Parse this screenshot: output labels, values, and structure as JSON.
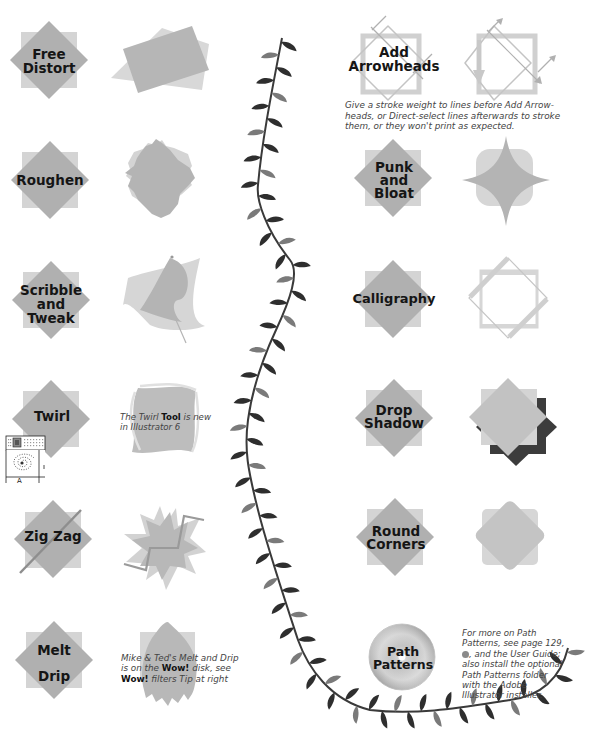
{
  "page": {
    "top_cutoff_text": "...",
    "colors": {
      "square_light": "#d4d4d4",
      "diamond_mid": "#b0b0b0",
      "result_fill": "#b6b6b6",
      "shadow_dark": "#3c3c3c",
      "vine_dark": "#2e2e2e",
      "vine_light": "#7a7a7a",
      "label_text": "#151515",
      "note_text": "#444444"
    }
  },
  "filters": {
    "left": [
      {
        "id": "free-distort",
        "label_lines": [
          "Free",
          "Distort"
        ]
      },
      {
        "id": "roughen",
        "label_lines": [
          "Roughen"
        ]
      },
      {
        "id": "scribble-tweak",
        "label_lines": [
          "Scribble",
          "and",
          "Tweak"
        ]
      },
      {
        "id": "twirl",
        "label_lines": [
          "Twirl"
        ]
      },
      {
        "id": "zig-zag",
        "label_lines": [
          "Zig Zag"
        ]
      },
      {
        "id": "melt-drip",
        "label_lines": [
          "Melt",
          "Drip"
        ]
      }
    ],
    "right": [
      {
        "id": "add-arrowheads",
        "label_lines": [
          "Add",
          "Arrowheads"
        ]
      },
      {
        "id": "punk-bloat",
        "label_lines": [
          "Punk",
          "and",
          "Bloat"
        ]
      },
      {
        "id": "calligraphy",
        "label_lines": [
          "Calligraphy"
        ]
      },
      {
        "id": "drop-shadow",
        "label_lines": [
          "Drop",
          "Shadow"
        ]
      },
      {
        "id": "round-corners",
        "label_lines": [
          "Round",
          "Corners"
        ]
      },
      {
        "id": "path-patterns",
        "label_lines": [
          "Path",
          "Patterns"
        ]
      }
    ]
  },
  "notes": {
    "arrowheads": {
      "line1": "Give a stroke weight to lines before Add Arrow-",
      "line2": "heads, or Direct-select lines afterwards to stroke",
      "line3": "them, or they won't print as expected."
    },
    "twirl": {
      "pre": "The Twirl ",
      "bold": "Tool",
      "post": " is new",
      "line2": "in Illustrator 6"
    },
    "melt": {
      "line1": "Mike & Ted's Melt and Drip",
      "line2_pre": "is on the ",
      "line2_bold": "Wow!",
      "line2_post": " disk, see",
      "line3_bold": "Wow!",
      "line3_post": " filters Tip at right"
    },
    "path_patterns": {
      "line1": "For more on Path",
      "line2": "Patterns, see page 129,",
      "line3_icon": "cd-icon",
      "line3_post": ", and the User Guide;",
      "line4": "also install the optional",
      "line5": "Path Patterns folder",
      "line6": "with the Adobe",
      "line7": "Illustrator installer."
    }
  },
  "twirl_tool_palette": {
    "label": "A"
  }
}
